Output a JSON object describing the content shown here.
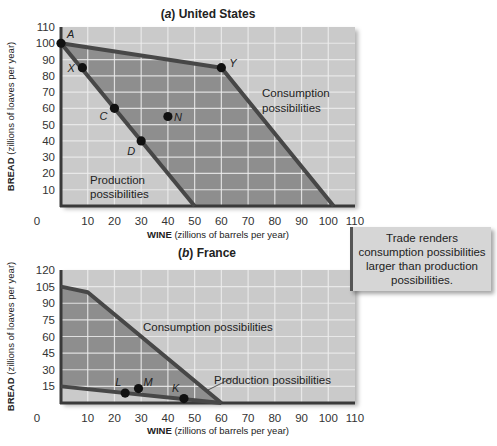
{
  "chart_data": [
    {
      "type": "line",
      "title": "(a) United States",
      "title_parts": {
        "letter": "a",
        "name": "United States"
      },
      "xlabel": "WINE (zillions of barrels per year)",
      "xlabel_bold": "WINE",
      "xlabel_rest": "(zillions of barrels per year)",
      "ylabel": "BREAD (zillions of loaves per year)",
      "ylabel_bold": "BREAD",
      "ylabel_rest": "(zillions of loaves per year)",
      "xlim": [
        0,
        110
      ],
      "ylim": [
        0,
        110
      ],
      "x_ticks": [
        0,
        10,
        20,
        30,
        40,
        50,
        60,
        70,
        80,
        90,
        100,
        110
      ],
      "y_ticks": [
        10,
        20,
        30,
        40,
        50,
        60,
        70,
        80,
        90,
        100,
        110
      ],
      "grid": true,
      "series": [
        {
          "name": "Production possibilities",
          "points": [
            [
              0,
              100
            ],
            [
              50,
              0
            ]
          ]
        },
        {
          "name": "Consumption possibilities",
          "points": [
            [
              0,
              100
            ],
            [
              60,
              85
            ],
            [
              102,
              0
            ]
          ]
        }
      ],
      "labeled_points": [
        {
          "label": "A",
          "x": 0,
          "y": 100
        },
        {
          "label": "X",
          "x": 8,
          "y": 85
        },
        {
          "label": "C",
          "x": 20,
          "y": 60
        },
        {
          "label": "D",
          "x": 30,
          "y": 40
        },
        {
          "label": "N",
          "x": 40,
          "y": 55
        },
        {
          "label": "Y",
          "x": 60,
          "y": 85
        }
      ],
      "annotations": [
        "Production possibilities",
        "Consumption possibilities"
      ]
    },
    {
      "type": "line",
      "title": "(b) France",
      "title_parts": {
        "letter": "b",
        "name": "France"
      },
      "xlabel": "WINE (zillions of barrels per year)",
      "xlabel_bold": "WINE",
      "xlabel_rest": "(zillions of barrels per year)",
      "ylabel": "BREAD (zillions of loaves per year)",
      "ylabel_bold": "BREAD",
      "ylabel_rest": "(zillions of loaves per year)",
      "xlim": [
        0,
        110
      ],
      "ylim": [
        0,
        120
      ],
      "x_ticks": [
        0,
        10,
        20,
        30,
        40,
        50,
        60,
        70,
        80,
        90,
        100,
        110
      ],
      "y_ticks": [
        15,
        30,
        45,
        60,
        75,
        90,
        105,
        120
      ],
      "grid": true,
      "series": [
        {
          "name": "Production possibilities",
          "points": [
            [
              0,
              15
            ],
            [
              60,
              0
            ]
          ]
        },
        {
          "name": "Consumption possibilities",
          "points": [
            [
              0,
              105
            ],
            [
              10,
              100
            ],
            [
              60,
              0
            ]
          ]
        }
      ],
      "labeled_points": [
        {
          "label": "L",
          "x": 24,
          "y": 9
        },
        {
          "label": "M",
          "x": 29,
          "y": 13
        },
        {
          "label": "K",
          "x": 46,
          "y": 4
        }
      ],
      "annotations": [
        "Consumption possibilities",
        "Production possibilities"
      ]
    }
  ],
  "callout": {
    "text": "Trade renders consumption possibilities larger than production possibilities."
  },
  "colors": {
    "background_light": "#cacaca",
    "region_dark": "#8e8e8e",
    "grid": "#eeeeee",
    "line": "#474747",
    "axis": "#3a3a3a",
    "marker": "#111111"
  }
}
